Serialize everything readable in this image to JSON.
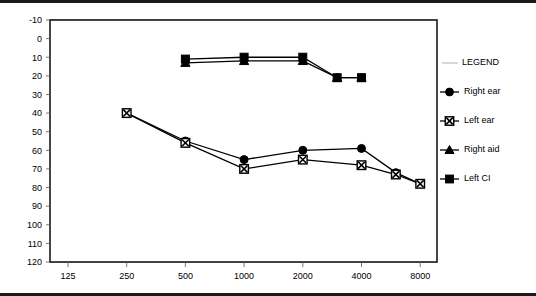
{
  "chart_data": {
    "type": "line",
    "title": "",
    "xlabel": "",
    "ylabel": "",
    "x": [
      125,
      250,
      500,
      1000,
      2000,
      3000,
      4000,
      6000,
      8000
    ],
    "xtick_labels": [
      "125",
      "250",
      "500",
      "1000",
      "2000",
      "4000",
      "8000"
    ],
    "xtick_values": [
      125,
      250,
      500,
      1000,
      2000,
      4000,
      8000
    ],
    "ytick_labels": [
      "-10",
      "0",
      "10",
      "20",
      "30",
      "40",
      "50",
      "60",
      "70",
      "80",
      "90",
      "100",
      "110",
      "120"
    ],
    "ytick_values": [
      -10,
      0,
      10,
      20,
      30,
      40,
      50,
      60,
      70,
      80,
      90,
      100,
      110,
      120
    ],
    "ylim": [
      -10,
      120
    ],
    "y_inverted": true,
    "grid": true,
    "legend_position": "right",
    "series": [
      {
        "name": "Right ear",
        "marker": "filled-circle",
        "points": [
          {
            "x": 250,
            "y": 40
          },
          {
            "x": 500,
            "y": 55
          },
          {
            "x": 1000,
            "y": 65
          },
          {
            "x": 2000,
            "y": 60
          },
          {
            "x": 4000,
            "y": 59
          },
          {
            "x": 6000,
            "y": 72
          },
          {
            "x": 8000,
            "y": 78
          }
        ]
      },
      {
        "name": "Left ear",
        "marker": "x-in-square",
        "points": [
          {
            "x": 250,
            "y": 40
          },
          {
            "x": 500,
            "y": 56
          },
          {
            "x": 1000,
            "y": 70
          },
          {
            "x": 2000,
            "y": 65
          },
          {
            "x": 4000,
            "y": 68
          },
          {
            "x": 6000,
            "y": 73
          },
          {
            "x": 8000,
            "y": 78
          }
        ]
      },
      {
        "name": "Right aid",
        "marker": "filled-triangle",
        "points": [
          {
            "x": 500,
            "y": 13
          },
          {
            "x": 1000,
            "y": 12
          },
          {
            "x": 2000,
            "y": 12
          },
          {
            "x": 3000,
            "y": 21
          },
          {
            "x": 4000,
            "y": 21
          }
        ]
      },
      {
        "name": "Left CI",
        "marker": "filled-square",
        "points": [
          {
            "x": 500,
            "y": 11
          },
          {
            "x": 1000,
            "y": 10
          },
          {
            "x": 2000,
            "y": 10
          },
          {
            "x": 3000,
            "y": 21
          },
          {
            "x": 4000,
            "y": 21
          }
        ]
      }
    ]
  },
  "legend": {
    "title": "LEGEND",
    "entries": [
      {
        "label": "Right ear",
        "marker": "filled-circle"
      },
      {
        "label": "Left ear",
        "marker": "x-in-square"
      },
      {
        "label": "Right aid",
        "marker": "filled-triangle"
      },
      {
        "label": "Left CI",
        "marker": "filled-square"
      }
    ]
  }
}
